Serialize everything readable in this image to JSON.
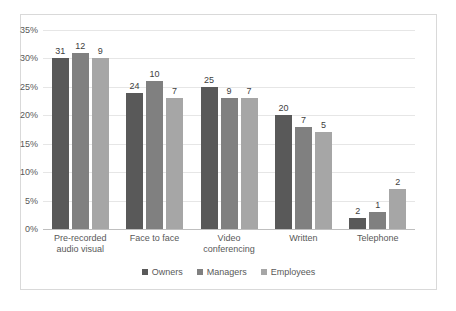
{
  "chart_data": {
    "type": "bar",
    "title": "",
    "xlabel": "",
    "ylabel": "",
    "ylim": [
      0,
      35
    ],
    "ytick_labels": [
      "0%",
      "5%",
      "10%",
      "15%",
      "20%",
      "25%",
      "30%",
      "35%"
    ],
    "ytick_values": [
      0,
      5,
      10,
      15,
      20,
      25,
      30,
      35
    ],
    "grid": true,
    "legend_position": "bottom",
    "categories": [
      [
        "Pre-recorded",
        "audio visual"
      ],
      [
        "Face to face"
      ],
      [
        "Video",
        "conferencing"
      ],
      [
        "Written"
      ],
      [
        "Telephone"
      ]
    ],
    "series": [
      {
        "name": "Owners",
        "color": "#595959",
        "values": [
          30,
          24,
          25,
          20,
          2
        ],
        "data_labels": [
          "31",
          "24",
          "25",
          "20",
          "2"
        ]
      },
      {
        "name": "Managers",
        "color": "#808080",
        "values": [
          31,
          26,
          23,
          18,
          3
        ],
        "data_labels": [
          "12",
          "10",
          "9",
          "7",
          "1"
        ]
      },
      {
        "name": "Employees",
        "color": "#a6a6a6",
        "values": [
          30,
          23,
          23,
          17,
          7
        ],
        "data_labels": [
          "9",
          "7",
          "7",
          "5",
          "2"
        ]
      }
    ]
  },
  "colors": {
    "border": "#d9d9d9",
    "gridline": "#e6e6e6",
    "axis": "#bfbfbf",
    "text": "#595959"
  }
}
